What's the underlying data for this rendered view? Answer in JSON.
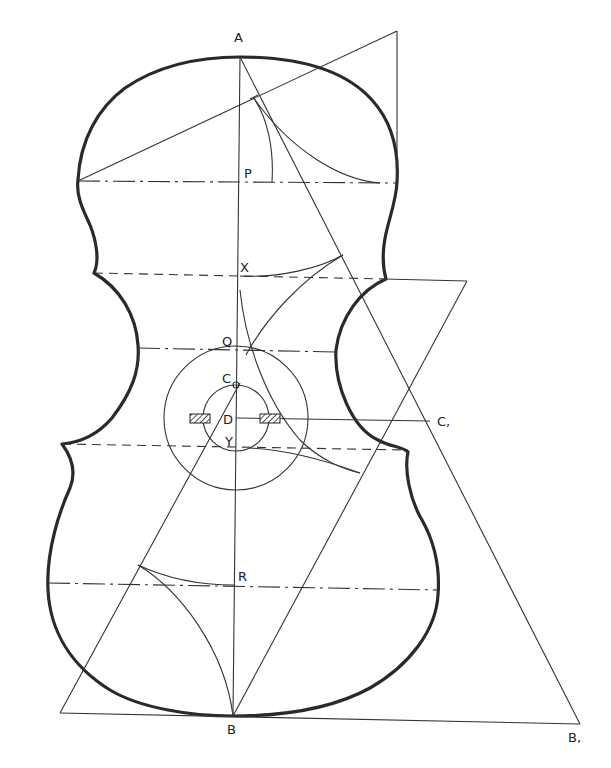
{
  "diagram": {
    "labels": {
      "A": "A",
      "P": "P",
      "X": "X",
      "Q": "Q",
      "C": "C",
      "D": "D",
      "Y": "Y",
      "C1": "C,",
      "R": "R",
      "B": "B",
      "B1": "B,"
    },
    "points": {
      "A": [
        240,
        48
      ],
      "P": [
        240,
        182
      ],
      "X": [
        240,
        276
      ],
      "Q": [
        240,
        349
      ],
      "C": [
        236,
        385
      ],
      "D": [
        236,
        418
      ],
      "Y": [
        236,
        448
      ],
      "C1": [
        430,
        421
      ],
      "R": [
        234,
        585
      ],
      "B": [
        233,
        716
      ],
      "B1": [
        580,
        724
      ]
    },
    "circles": [
      {
        "name": "outer-circle",
        "cx": 236,
        "cy": 418,
        "r": 72
      },
      {
        "name": "inner-circle",
        "cx": 236,
        "cy": 418,
        "r": 33
      }
    ],
    "colors": {
      "ink": "#2a2a2a",
      "paper": "#ffffff"
    }
  }
}
